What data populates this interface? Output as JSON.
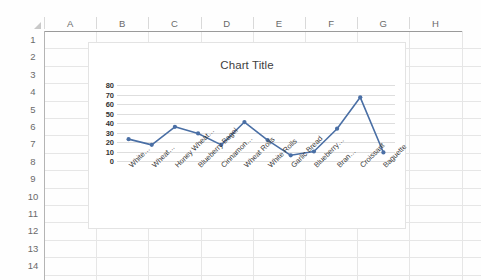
{
  "spreadsheet": {
    "columns": [
      "A",
      "B",
      "C",
      "D",
      "E",
      "F",
      "G",
      "H"
    ],
    "rows": [
      "1",
      "2",
      "3",
      "4",
      "5",
      "6",
      "7",
      "8",
      "9",
      "10",
      "11",
      "12",
      "13",
      "14"
    ],
    "corner_name": "select-all-corner"
  },
  "chart": {
    "title": "Chart Title"
  },
  "chart_data": {
    "type": "line",
    "title": "Chart Title",
    "xlabel": "",
    "ylabel": "",
    "ylim": [
      0,
      80
    ],
    "yticks": [
      0,
      10,
      20,
      30,
      40,
      50,
      60,
      70,
      80
    ],
    "ytick_labels": [
      "0",
      "10",
      "20",
      "30",
      "40",
      "50",
      "60",
      "70",
      "80"
    ],
    "grid": true,
    "legend": false,
    "series_color": "#4A6FA5",
    "categories": [
      "White…",
      "Wheat…",
      "Honey Wheat…",
      "Blueberry Bagel",
      "Cinnamon…",
      "Wheat Rolls",
      "White Rolls",
      "Garlic Bread",
      "Blueberry…",
      "Bran…",
      "Croissant",
      "Baguette"
    ],
    "values": [
      23,
      17,
      36,
      29,
      17,
      41,
      22,
      6,
      10,
      34,
      67,
      9
    ]
  }
}
